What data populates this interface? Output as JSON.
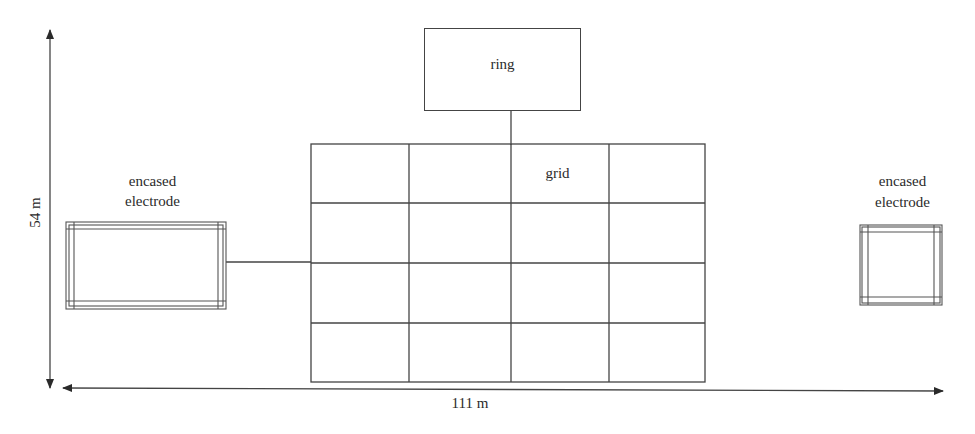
{
  "diagram": {
    "ring": {
      "label": "ring"
    },
    "grid": {
      "label": "grid",
      "rows": 4,
      "cols": 4
    },
    "left_electrode": {
      "label_line1": "encased",
      "label_line2": "electrode"
    },
    "right_electrode": {
      "label_line1": "encased",
      "label_line2": "electrode"
    },
    "dimensions": {
      "height": "54 m",
      "width": "111 m"
    }
  }
}
